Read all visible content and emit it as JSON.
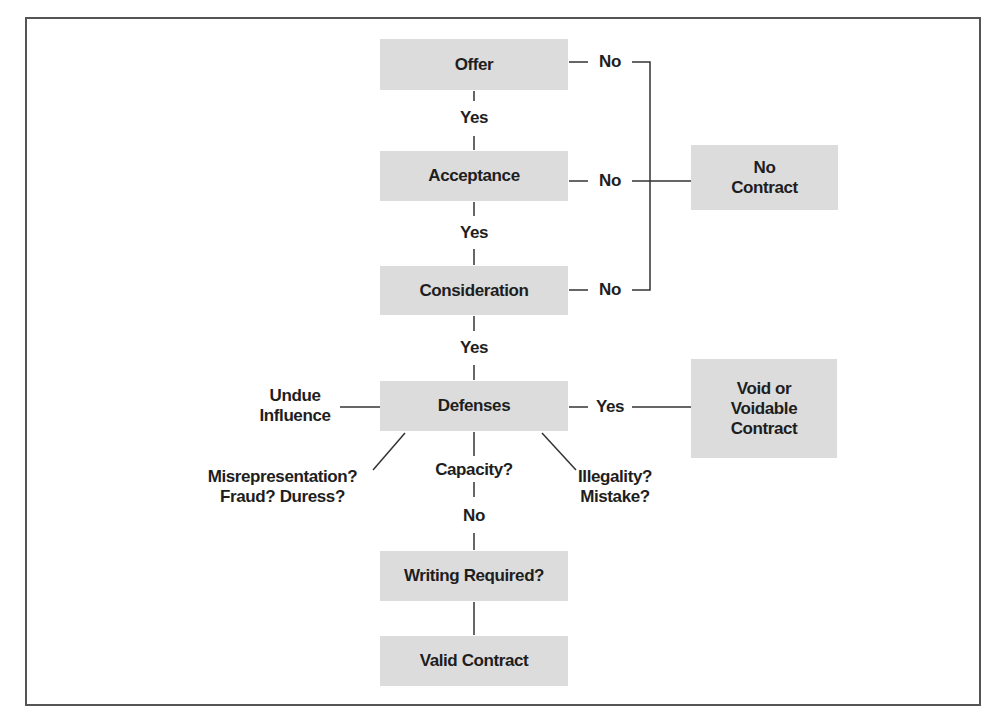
{
  "diagram": {
    "nodes": {
      "offer": "Offer",
      "acceptance": "Acceptance",
      "consideration": "Consideration",
      "defenses": "Defenses",
      "writing_required": "Writing Required?",
      "valid_contract": "Valid Contract",
      "no_contract_line1": "No",
      "no_contract_line2": "Contract",
      "void_line1": "Void or",
      "void_line2": "Voidable",
      "void_line3": "Contract"
    },
    "edge_labels": {
      "offer_yes": "Yes",
      "acceptance_yes": "Yes",
      "consideration_yes": "Yes",
      "offer_no": "No",
      "acceptance_no": "No",
      "consideration_no": "No",
      "defenses_yes": "Yes",
      "capacity_no": "No"
    },
    "defense_types": {
      "undue_line1": "Undue",
      "undue_line2": "Influence",
      "misrep_line1": "Misrepresentation?",
      "misrep_line2": "Fraud? Duress?",
      "capacity": "Capacity?",
      "illegality_line1": "Illegality?",
      "illegality_line2": "Mistake?"
    },
    "colors": {
      "box_fill": "#dcdcdc",
      "text": "#1e1e1e",
      "line": "#333333",
      "frame": "#555555"
    }
  }
}
